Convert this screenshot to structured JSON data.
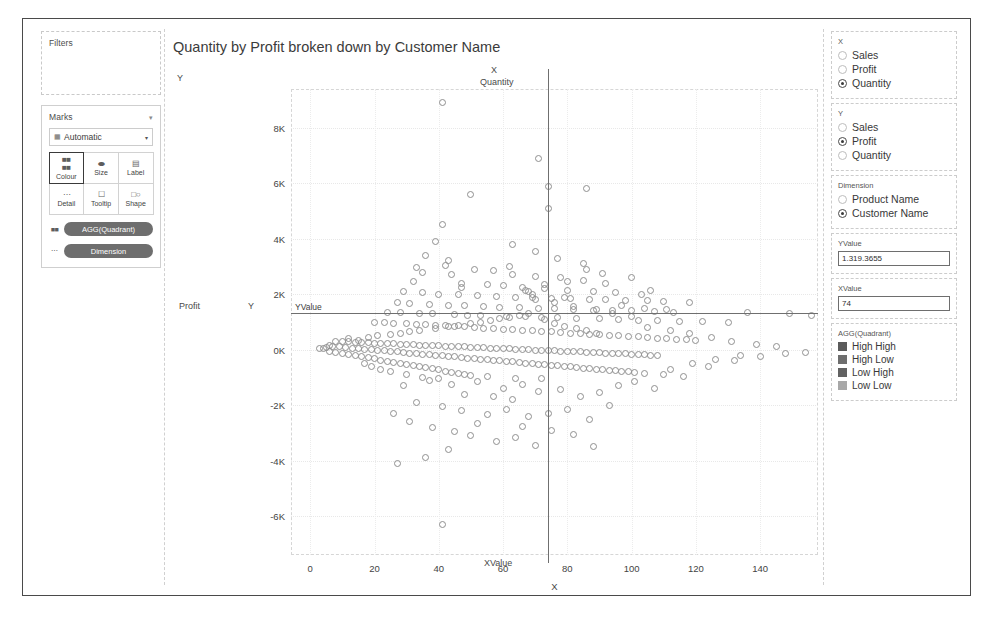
{
  "left_panel": {
    "filters": {
      "title": "Filters"
    },
    "marks": {
      "title": "Marks",
      "collapse_icon": "chevron-down-icon",
      "mark_type": {
        "value": "Automatic",
        "glyph": "bar-icon",
        "caret": "chevron-down-icon"
      },
      "buttons": [
        {
          "label": "Colour",
          "icon": "colour-icon",
          "selected": true
        },
        {
          "label": "Size",
          "icon": "size-icon",
          "selected": false
        },
        {
          "label": "Label",
          "icon": "label-icon",
          "selected": false
        },
        {
          "label": "Detail",
          "icon": "detail-icon",
          "selected": false
        },
        {
          "label": "Tooltip",
          "icon": "tooltip-icon",
          "selected": false
        },
        {
          "label": "Shape",
          "icon": "shape-icon",
          "selected": false
        }
      ],
      "pills": [
        {
          "label": "AGG(Quadrant)",
          "icon": "colour-icon"
        },
        {
          "label": "Dimension",
          "icon": "detail-icon"
        }
      ]
    }
  },
  "viz": {
    "title": "Quantity by Profit broken down by Customer Name",
    "y_corner_label": "Y",
    "x_corner_label": "X",
    "x_field_label": "Quantity",
    "y_field_label": "Profit",
    "y_axis_letter": "Y",
    "x_axis_letter": "X",
    "reference_lines": {
      "y_label": "YValue",
      "x_label": "XValue"
    }
  },
  "right_panel": {
    "x_group": {
      "title": "X",
      "options": [
        {
          "label": "Sales",
          "selected": false
        },
        {
          "label": "Profit",
          "selected": false
        },
        {
          "label": "Quantity",
          "selected": true
        }
      ]
    },
    "y_group": {
      "title": "Y",
      "options": [
        {
          "label": "Sales",
          "selected": false
        },
        {
          "label": "Profit",
          "selected": true
        },
        {
          "label": "Quantity",
          "selected": false
        }
      ]
    },
    "dimension_group": {
      "title": "Dimension",
      "options": [
        {
          "label": "Product Name",
          "selected": false
        },
        {
          "label": "Customer Name",
          "selected": true
        }
      ]
    },
    "yvalue_field": {
      "title": "YValue",
      "value": "1.319.3655"
    },
    "xvalue_field": {
      "title": "XValue",
      "value": "74"
    },
    "legend": {
      "title": "AGG(Quadrant)",
      "entries": [
        {
          "label": "High High",
          "color": "#5b5b5b"
        },
        {
          "label": "High Low",
          "color": "#6e6e6e"
        },
        {
          "label": "Low High",
          "color": "#626262"
        },
        {
          "label": "Low Low",
          "color": "#a8a8a8"
        }
      ]
    }
  },
  "chart_data": {
    "type": "scatter",
    "title": "Quantity by Profit broken down by Customer Name",
    "xlabel": "X",
    "ylabel": "Profit",
    "x_field": "Quantity",
    "y_field": "Profit",
    "grid": true,
    "legend_position": "right",
    "xlim": [
      -6,
      158
    ],
    "ylim": [
      -7400,
      9400
    ],
    "xticks": [
      0,
      20,
      40,
      60,
      80,
      100,
      120,
      140
    ],
    "yticks": [
      -6000,
      -4000,
      -2000,
      0,
      2000,
      4000,
      6000,
      8000
    ],
    "ytick_labels": [
      "-6K",
      "-4K",
      "-2K",
      "0K",
      "2K",
      "4K",
      "6K",
      "8K"
    ],
    "reference_lines": [
      {
        "name": "YValue",
        "orientation": "horizontal",
        "value": 1319.3655,
        "label": "YValue"
      },
      {
        "name": "XValue",
        "orientation": "vertical",
        "value": 74,
        "label": "XValue"
      }
    ],
    "marker": {
      "shape": "circle-open",
      "stroke": "#8f8f8f",
      "size": 7
    },
    "points": [
      [
        41,
        8900
      ],
      [
        71,
        6900
      ],
      [
        74,
        5900
      ],
      [
        86,
        5800
      ],
      [
        50,
        5600
      ],
      [
        41,
        4500
      ],
      [
        39,
        3900
      ],
      [
        74,
        5100
      ],
      [
        36,
        3400
      ],
      [
        33,
        2950
      ],
      [
        42,
        3050
      ],
      [
        51,
        2900
      ],
      [
        57,
        2850
      ],
      [
        44,
        2700
      ],
      [
        63,
        2700
      ],
      [
        70,
        2650
      ],
      [
        78,
        2600
      ],
      [
        85,
        2500
      ],
      [
        32,
        2450
      ],
      [
        47,
        2400
      ],
      [
        55,
        2350
      ],
      [
        60,
        2300
      ],
      [
        66,
        2250
      ],
      [
        73,
        2200
      ],
      [
        80,
        2150
      ],
      [
        88,
        2100
      ],
      [
        95,
        2050
      ],
      [
        103,
        2000
      ],
      [
        29,
        2100
      ],
      [
        35,
        2050
      ],
      [
        40,
        2000
      ],
      [
        46,
        1980
      ],
      [
        52,
        1950
      ],
      [
        58,
        1920
      ],
      [
        64,
        1900
      ],
      [
        69,
        1880
      ],
      [
        75,
        1860
      ],
      [
        81,
        1840
      ],
      [
        87,
        1820
      ],
      [
        92,
        1800
      ],
      [
        98,
        1780
      ],
      [
        105,
        1760
      ],
      [
        110,
        1740
      ],
      [
        118,
        1720
      ],
      [
        136,
        1350
      ],
      [
        149,
        1300
      ],
      [
        156,
        1250
      ],
      [
        27,
        1700
      ],
      [
        31,
        1650
      ],
      [
        37,
        1620
      ],
      [
        43,
        1600
      ],
      [
        48,
        1580
      ],
      [
        54,
        1560
      ],
      [
        59,
        1540
      ],
      [
        65,
        1520
      ],
      [
        71,
        1500
      ],
      [
        76,
        1480
      ],
      [
        82,
        1460
      ],
      [
        89,
        1440
      ],
      [
        94,
        1420
      ],
      [
        100,
        1400
      ],
      [
        107,
        1380
      ],
      [
        113,
        1360
      ],
      [
        24,
        1350
      ],
      [
        28,
        1330
      ],
      [
        34,
        1310
      ],
      [
        38,
        1290
      ],
      [
        45,
        1270
      ],
      [
        49,
        1250
      ],
      [
        53,
        1230
      ],
      [
        61,
        1210
      ],
      [
        67,
        1190
      ],
      [
        72,
        1170
      ],
      [
        77,
        1150
      ],
      [
        83,
        1130
      ],
      [
        90,
        1110
      ],
      [
        96,
        1090
      ],
      [
        102,
        1070
      ],
      [
        108,
        1050
      ],
      [
        115,
        1030
      ],
      [
        122,
        1010
      ],
      [
        130,
        990
      ],
      [
        20,
        1000
      ],
      [
        23,
        980
      ],
      [
        26,
        960
      ],
      [
        30,
        940
      ],
      [
        33,
        920
      ],
      [
        36,
        900
      ],
      [
        39,
        880
      ],
      [
        42,
        860
      ],
      [
        45,
        840
      ],
      [
        48,
        820
      ],
      [
        51,
        800
      ],
      [
        54,
        780
      ],
      [
        57,
        760
      ],
      [
        60,
        740
      ],
      [
        63,
        720
      ],
      [
        66,
        700
      ],
      [
        69,
        680
      ],
      [
        72,
        660
      ],
      [
        75,
        640
      ],
      [
        78,
        620
      ],
      [
        81,
        600
      ],
      [
        84,
        580
      ],
      [
        87,
        560
      ],
      [
        90,
        540
      ],
      [
        93,
        520
      ],
      [
        96,
        500
      ],
      [
        99,
        480
      ],
      [
        102,
        460
      ],
      [
        105,
        440
      ],
      [
        108,
        420
      ],
      [
        111,
        400
      ],
      [
        114,
        380
      ],
      [
        117,
        360
      ],
      [
        120,
        340
      ],
      [
        8,
        300
      ],
      [
        10,
        290
      ],
      [
        12,
        280
      ],
      [
        14,
        270
      ],
      [
        16,
        260
      ],
      [
        18,
        250
      ],
      [
        20,
        240
      ],
      [
        22,
        230
      ],
      [
        24,
        220
      ],
      [
        26,
        210
      ],
      [
        28,
        200
      ],
      [
        30,
        190
      ],
      [
        32,
        180
      ],
      [
        34,
        170
      ],
      [
        36,
        160
      ],
      [
        38,
        150
      ],
      [
        40,
        140
      ],
      [
        42,
        130
      ],
      [
        44,
        120
      ],
      [
        46,
        110
      ],
      [
        48,
        100
      ],
      [
        50,
        90
      ],
      [
        52,
        80
      ],
      [
        54,
        70
      ],
      [
        56,
        60
      ],
      [
        58,
        50
      ],
      [
        60,
        40
      ],
      [
        62,
        30
      ],
      [
        64,
        20
      ],
      [
        66,
        10
      ],
      [
        68,
        0
      ],
      [
        70,
        -10
      ],
      [
        72,
        -20
      ],
      [
        74,
        -30
      ],
      [
        76,
        -40
      ],
      [
        78,
        -50
      ],
      [
        80,
        -60
      ],
      [
        82,
        -70
      ],
      [
        84,
        -80
      ],
      [
        86,
        -90
      ],
      [
        88,
        -100
      ],
      [
        90,
        -110
      ],
      [
        92,
        -120
      ],
      [
        94,
        -130
      ],
      [
        96,
        -140
      ],
      [
        98,
        -150
      ],
      [
        100,
        -160
      ],
      [
        102,
        -170
      ],
      [
        104,
        -180
      ],
      [
        106,
        -190
      ],
      [
        108,
        -200
      ],
      [
        6,
        150
      ],
      [
        7,
        120
      ],
      [
        9,
        100
      ],
      [
        11,
        80
      ],
      [
        13,
        60
      ],
      [
        15,
        40
      ],
      [
        17,
        20
      ],
      [
        19,
        0
      ],
      [
        21,
        -20
      ],
      [
        23,
        -40
      ],
      [
        25,
        -60
      ],
      [
        27,
        -80
      ],
      [
        29,
        -100
      ],
      [
        31,
        -120
      ],
      [
        33,
        -140
      ],
      [
        35,
        -160
      ],
      [
        37,
        -180
      ],
      [
        39,
        -200
      ],
      [
        41,
        -220
      ],
      [
        43,
        -240
      ],
      [
        45,
        -260
      ],
      [
        47,
        -280
      ],
      [
        49,
        -300
      ],
      [
        51,
        -320
      ],
      [
        53,
        -340
      ],
      [
        55,
        -360
      ],
      [
        57,
        -380
      ],
      [
        59,
        -400
      ],
      [
        61,
        -420
      ],
      [
        63,
        -440
      ],
      [
        65,
        -460
      ],
      [
        67,
        -480
      ],
      [
        69,
        -500
      ],
      [
        71,
        -520
      ],
      [
        73,
        -540
      ],
      [
        75,
        -560
      ],
      [
        77,
        -580
      ],
      [
        79,
        -600
      ],
      [
        81,
        -620
      ],
      [
        83,
        -640
      ],
      [
        85,
        -660
      ],
      [
        87,
        -680
      ],
      [
        89,
        -700
      ],
      [
        91,
        -720
      ],
      [
        93,
        -740
      ],
      [
        95,
        -760
      ],
      [
        97,
        -780
      ],
      [
        99,
        -800
      ],
      [
        101,
        -820
      ],
      [
        104,
        -850
      ],
      [
        110,
        -900
      ],
      [
        116,
        -950
      ],
      [
        124,
        -600
      ],
      [
        132,
        -400
      ],
      [
        140,
        -250
      ],
      [
        148,
        -150
      ],
      [
        154,
        -100
      ],
      [
        37,
        -1100
      ],
      [
        44,
        -1250
      ],
      [
        29,
        -1300
      ],
      [
        52,
        -1150
      ],
      [
        60,
        -1400
      ],
      [
        66,
        -1250
      ],
      [
        71,
        -1500
      ],
      [
        48,
        -1600
      ],
      [
        57,
        -1700
      ],
      [
        63,
        -1800
      ],
      [
        78,
        -1450
      ],
      [
        84,
        -1700
      ],
      [
        90,
        -1550
      ],
      [
        96,
        -1300
      ],
      [
        33,
        -1900
      ],
      [
        41,
        -2050
      ],
      [
        47,
        -2200
      ],
      [
        55,
        -2350
      ],
      [
        61,
        -2150
      ],
      [
        68,
        -2400
      ],
      [
        74,
        -2300
      ],
      [
        80,
        -2150
      ],
      [
        87,
        -2500
      ],
      [
        93,
        -2000
      ],
      [
        26,
        -2300
      ],
      [
        31,
        -2600
      ],
      [
        38,
        -2800
      ],
      [
        45,
        -2950
      ],
      [
        50,
        -3100
      ],
      [
        58,
        -3300
      ],
      [
        64,
        -3150
      ],
      [
        70,
        -3450
      ],
      [
        43,
        -3600
      ],
      [
        36,
        -3900
      ],
      [
        27,
        -4100
      ],
      [
        41,
        -6300
      ],
      [
        52,
        -2650
      ],
      [
        66,
        -2750
      ],
      [
        75,
        -2900
      ],
      [
        82,
        -3050
      ],
      [
        88,
        -3500
      ],
      [
        101,
        -1150
      ],
      [
        107,
        -1400
      ],
      [
        112,
        -700
      ],
      [
        119,
        -500
      ],
      [
        126,
        -350
      ],
      [
        134,
        -200
      ],
      [
        43,
        3200
      ],
      [
        47,
        2250
      ],
      [
        35,
        2800
      ],
      [
        62,
        3000
      ],
      [
        68,
        2100
      ],
      [
        79,
        1900
      ],
      [
        92,
        2400
      ],
      [
        100,
        2600
      ],
      [
        106,
        2150
      ],
      [
        86,
        2900
      ],
      [
        91,
        2750
      ],
      [
        97,
        1600
      ],
      [
        104,
        1500
      ],
      [
        111,
        1450
      ],
      [
        12,
        400
      ],
      [
        15,
        350
      ],
      [
        18,
        450
      ],
      [
        21,
        500
      ],
      [
        25,
        550
      ],
      [
        28,
        600
      ],
      [
        31,
        650
      ],
      [
        34,
        700
      ],
      [
        39,
        750
      ],
      [
        43,
        820
      ],
      [
        46,
        880
      ],
      [
        50,
        940
      ],
      [
        53,
        1000
      ],
      [
        56,
        1060
      ],
      [
        59,
        1120
      ],
      [
        62,
        1180
      ],
      [
        65,
        1240
      ],
      [
        68,
        1300
      ],
      [
        73,
        1100
      ],
      [
        76,
        950
      ],
      [
        79,
        850
      ],
      [
        83,
        760
      ],
      [
        86,
        680
      ],
      [
        89,
        590
      ],
      [
        5,
        80
      ],
      [
        4,
        50
      ],
      [
        3,
        30
      ],
      [
        6,
        -50
      ],
      [
        8,
        -90
      ],
      [
        10,
        -130
      ],
      [
        12,
        -170
      ],
      [
        14,
        -210
      ],
      [
        16,
        -250
      ],
      [
        18,
        -290
      ],
      [
        20,
        -330
      ],
      [
        22,
        -370
      ],
      [
        24,
        -410
      ],
      [
        26,
        -450
      ],
      [
        28,
        -490
      ],
      [
        30,
        -530
      ],
      [
        32,
        -570
      ],
      [
        34,
        -610
      ],
      [
        36,
        -650
      ],
      [
        38,
        -690
      ],
      [
        40,
        -730
      ],
      [
        42,
        -770
      ],
      [
        44,
        -810
      ],
      [
        46,
        -850
      ],
      [
        48,
        -890
      ],
      [
        50,
        -930
      ],
      [
        55,
        -980
      ],
      [
        64,
        -1050
      ],
      [
        72,
        -1020
      ],
      [
        22,
        -700
      ],
      [
        25,
        -800
      ],
      [
        19,
        -600
      ],
      [
        17,
        -500
      ],
      [
        30,
        -900
      ],
      [
        35,
        -1000
      ],
      [
        40,
        -1050
      ],
      [
        100,
        1200
      ],
      [
        94,
        1300
      ],
      [
        88,
        1400
      ],
      [
        82,
        1550
      ],
      [
        76,
        1700
      ],
      [
        70,
        1820
      ],
      [
        69,
        2000
      ],
      [
        105,
        800
      ],
      [
        112,
        700
      ],
      [
        118,
        600
      ],
      [
        125,
        450
      ],
      [
        131,
        300
      ],
      [
        139,
        180
      ],
      [
        145,
        100
      ],
      [
        67,
        2150
      ],
      [
        73,
        2350
      ],
      [
        80,
        2450
      ],
      [
        85,
        3100
      ],
      [
        77,
        3300
      ],
      [
        70,
        3550
      ],
      [
        63,
        3800
      ]
    ]
  }
}
